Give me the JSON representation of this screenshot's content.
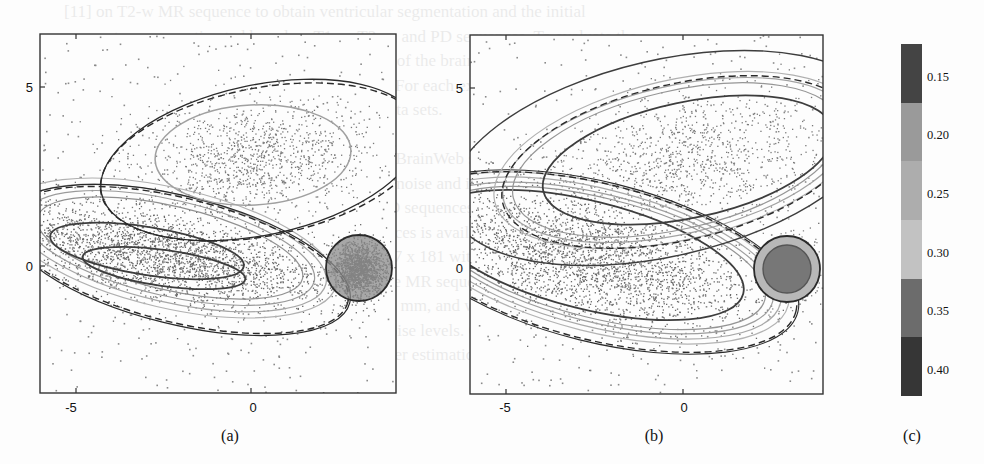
{
  "background_text_lines": [
    "[11] on T2-w MR sequence to obtain ventricular segmentation and the initial",
    "parameters were estimated based on T1-w, T2-w, and PD sequences. To evaluate the",
    "performance of the estimation, the segmentation of the brain tissues and the resulting",
    "segmentation were compared with ground truth. For each experiment, the following",
    "was evaluated with the synthetic data and real data sets.",
    "",
    "Synthetic MR brain images were taken from the BrainWeb simulator",
    "[13] to evaluate performance for the presence of noise and intensity",
    "non-uniformity. We used the T1-w, T2-w, and PD sequences with",
    "levels of noise. The ground truth of these sequences is available in",
    "[12]. These images have dimensions of 181 x 217 x 181 with voxel",
    "sizes 1 mm. Each of these was composed of three MR sequences (T1, T2, PD)",
    "PD-w) that were simulated with a resolution of 1 mm, and with noise levels",
    "slice thickness, 20 % inhomogeneity, and 3 % noise levels. Only samples within the",
    "intracranial mask were used for mixture parameter estimation."
  ],
  "chart_data": [
    {
      "panel": "(a)",
      "type": "scatter",
      "title": "",
      "xlabel": "",
      "ylabel": "",
      "xlim": [
        -6,
        4.2
      ],
      "ylim": [
        -5.8,
        6.2
      ],
      "x_ticks": [
        "-5",
        "0"
      ],
      "y_ticks": [
        "0",
        "5"
      ],
      "grid": false,
      "clusters": [
        {
          "name": "upper elongated cluster",
          "center": [
            1.0,
            3.0
          ],
          "semi_axes": [
            2.8,
            1.5
          ],
          "angle_deg": 13
        },
        {
          "name": "lower-left elongated cluster",
          "center": [
            -3.3,
            0.0
          ],
          "semi_axes": [
            3.5,
            1.0
          ],
          "angle_deg": -12,
          "density": "high"
        },
        {
          "name": "small circular cluster",
          "center": [
            3.0,
            0.0
          ],
          "radius": 0.95,
          "density": "very high"
        },
        {
          "name": "uniform background outliers",
          "range_x": [
            -6,
            4.2
          ],
          "range_y": [
            -5.8,
            6.2
          ]
        }
      ],
      "contours": [
        {
          "style": "dashed dark",
          "description": "true component boundary"
        },
        {
          "style": "solid dark",
          "description": "estimated component boundary"
        },
        {
          "style": "solid grey",
          "description": "density iso-contours"
        }
      ]
    },
    {
      "panel": "(b)",
      "type": "scatter",
      "title": "",
      "xlabel": "",
      "ylabel": "",
      "xlim": [
        -6,
        4.2
      ],
      "ylim": [
        -5.8,
        6.2
      ],
      "x_ticks": [
        "-5",
        "0"
      ],
      "y_ticks": [
        "0",
        "5"
      ],
      "grid": false,
      "clusters": [
        {
          "name": "upper elongated cluster",
          "center": [
            1.3,
            3.0
          ],
          "semi_axes": [
            3.4,
            1.9
          ],
          "angle_deg": 13
        },
        {
          "name": "lower-left elongated cluster",
          "center": [
            -3.0,
            0.0
          ],
          "semi_axes": [
            4.0,
            1.4
          ],
          "angle_deg": -12,
          "density": "high"
        },
        {
          "name": "small circular cluster",
          "center": [
            2.9,
            0.0
          ],
          "radius": 0.95,
          "density": "very high"
        },
        {
          "name": "uniform background outliers",
          "range_x": [
            -6,
            4.2
          ],
          "range_y": [
            -5.8,
            6.2
          ]
        }
      ],
      "contours": [
        {
          "style": "dashed dark",
          "description": "true component boundary"
        },
        {
          "style": "solid dark",
          "description": "estimated component boundary"
        },
        {
          "style": "solid grey",
          "description": "density iso-contours"
        }
      ]
    },
    {
      "panel": "(c)",
      "type": "heatmap",
      "title": "colorbar",
      "orientation": "vertical",
      "ticks": [
        "0.15",
        "0.20",
        "0.25",
        "0.30",
        "0.35",
        "0.40"
      ],
      "bands": [
        {
          "value": 0.15,
          "color": "#444444"
        },
        {
          "value": 0.2,
          "color": "#9a9a9a"
        },
        {
          "value": 0.25,
          "color": "#adadad"
        },
        {
          "value": 0.3,
          "color": "#c2c2c2"
        },
        {
          "value": 0.35,
          "color": "#6c6c6c"
        },
        {
          "value": 0.4,
          "color": "#363636"
        }
      ]
    }
  ],
  "panels": {
    "a": {
      "caption": "(a)",
      "x_ticks": [
        "-5",
        "0"
      ],
      "y_ticks": [
        "5",
        "0"
      ]
    },
    "b": {
      "caption": "(b)",
      "x_ticks": [
        "-5",
        "0"
      ],
      "y_ticks": [
        "5",
        "0"
      ]
    },
    "c": {
      "caption": "(c)",
      "labels": [
        "0.15",
        "0.20",
        "0.25",
        "0.30",
        "0.35",
        "0.40"
      ]
    }
  },
  "colors": {
    "frame": "#333333",
    "point": "#666666",
    "contour_dark": "#2a2a2a",
    "contour_grey": "#9a9a9a",
    "fill_light": "#d8d8d8"
  }
}
